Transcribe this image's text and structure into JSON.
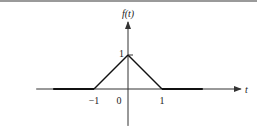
{
  "chart_data": {
    "type": "line",
    "title": "",
    "ylabel": "f(t)",
    "xlabel": "t",
    "xlim": [
      -2.7,
      2.2
    ],
    "ylim": [
      -0.85,
      1.6
    ],
    "grid": false,
    "legend": "none",
    "x_ticks": [
      {
        "value": -1,
        "label": "−1"
      },
      {
        "value": 0,
        "label": "0"
      },
      {
        "value": 1,
        "label": "1"
      }
    ],
    "y_ticks": [
      {
        "value": 1,
        "label": "1"
      }
    ],
    "series": [
      {
        "name": "f(t)",
        "x": [
          -2.2,
          -1,
          0,
          1,
          2.2
        ],
        "y": [
          0,
          0,
          1,
          0,
          0
        ]
      }
    ],
    "colors": {
      "axis": "#333333",
      "curve": "#111111",
      "border": "#9a9a9a"
    }
  }
}
